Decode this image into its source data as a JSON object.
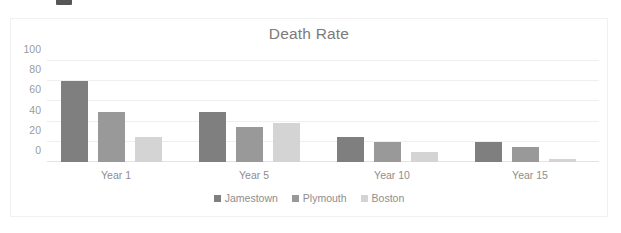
{
  "chart_data": {
    "type": "bar",
    "title": "Death Rate",
    "xlabel": "",
    "ylabel": "",
    "categories": [
      "Year 1",
      "Year 5",
      "Year 10",
      "Year 15"
    ],
    "series": [
      {
        "name": "Jamestown",
        "color": "#7f7f7f",
        "values": [
          80,
          50,
          25,
          20
        ]
      },
      {
        "name": "Plymouth",
        "color": "#999999",
        "values": [
          50,
          35,
          20,
          15
        ]
      },
      {
        "name": "Boston",
        "color": "#d4d4d4",
        "values": [
          25,
          39,
          10,
          3
        ]
      }
    ],
    "ylim": [
      0,
      100
    ],
    "yticks": [
      0,
      20,
      40,
      60,
      80,
      100
    ],
    "ytick_labels": [
      "0",
      "20",
      "40",
      "60",
      "80",
      "100"
    ],
    "grid": true,
    "grid_axis": "y",
    "legend": true,
    "legend_position": "bottom"
  },
  "figure": {
    "border_color": "#f1f1f1",
    "background": "#ffffff",
    "title_color": "#7b7b7b",
    "tick_color": "#9b9b9b",
    "label_color": "#8d8d8d",
    "gridline_color": "#efefef",
    "axis_line_color": "#e3e3e3"
  }
}
